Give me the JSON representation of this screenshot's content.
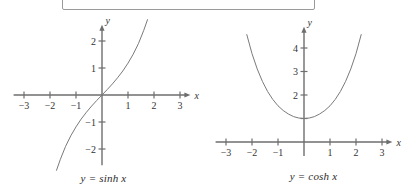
{
  "figure": {
    "background_color": "#ffffff",
    "axis_color": "#6e6e6e",
    "curve_color": "#7a7a7a",
    "text_color": "#333333",
    "box_border_color": "#9a9a9a"
  },
  "top_box": {
    "label": ""
  },
  "panels": [
    {
      "id": "sinh",
      "caption": "y = sinh x",
      "x_axis_name": "x",
      "y_axis_name": "y",
      "x_ticks": [
        "−3",
        "−2",
        "−1",
        "1",
        "2",
        "3"
      ],
      "y_ticks": [
        "2",
        "1",
        "−1",
        "−2"
      ]
    },
    {
      "id": "cosh",
      "caption": "y = cosh x",
      "x_axis_name": "x",
      "y_axis_name": "y",
      "x_ticks": [
        "−3",
        "−2",
        "−1",
        "1",
        "2",
        "3"
      ],
      "y_ticks": [
        "4",
        "3",
        "2"
      ]
    }
  ],
  "chart_data": [
    {
      "type": "line",
      "id": "sinh",
      "title": "y = sinh x",
      "xlabel": "x",
      "ylabel": "y",
      "xlim": [
        -3.4,
        3.4
      ],
      "ylim": [
        -2.6,
        2.6
      ],
      "xticks": [
        -3,
        -2,
        -1,
        1,
        2,
        3
      ],
      "xtick_labels": [
        "−3",
        "−2",
        "−1",
        "1",
        "2",
        "3"
      ],
      "yticks": [
        -2,
        -1,
        1,
        2
      ],
      "ytick_labels": [
        "−2",
        "−1",
        "1",
        "2"
      ],
      "grid": false,
      "legend": "none",
      "series": [
        {
          "name": "sinh x",
          "x": [
            -1.75,
            -1.6,
            -1.4,
            -1.2,
            -1.0,
            -0.8,
            -0.6,
            -0.4,
            -0.2,
            0.0,
            0.2,
            0.4,
            0.6,
            0.8,
            1.0,
            1.2,
            1.4,
            1.6,
            1.75
          ],
          "y": [
            -2.79,
            -2.38,
            -1.9,
            -1.51,
            -1.18,
            -0.89,
            -0.64,
            -0.41,
            -0.2,
            0.0,
            0.2,
            0.41,
            0.64,
            0.89,
            1.18,
            1.51,
            1.9,
            2.38,
            2.79
          ]
        }
      ]
    },
    {
      "type": "line",
      "id": "cosh",
      "title": "y = cosh x",
      "xlabel": "x",
      "ylabel": "y",
      "xlim": [
        -3.4,
        3.4
      ],
      "ylim": [
        -0.6,
        4.9
      ],
      "xticks": [
        -3,
        -2,
        -1,
        1,
        2,
        3
      ],
      "xtick_labels": [
        "−3",
        "−2",
        "−1",
        "1",
        "2",
        "3"
      ],
      "yticks": [
        1,
        2,
        3,
        4
      ],
      "ytick_labels": [
        "",
        "2",
        "3",
        "4"
      ],
      "grid": false,
      "legend": "none",
      "series": [
        {
          "name": "cosh x",
          "x": [
            -2.2,
            -2.0,
            -1.8,
            -1.6,
            -1.4,
            -1.2,
            -1.0,
            -0.8,
            -0.6,
            -0.4,
            -0.2,
            0.0,
            0.2,
            0.4,
            0.6,
            0.8,
            1.0,
            1.2,
            1.4,
            1.6,
            1.8,
            2.0,
            2.2
          ],
          "y": [
            4.57,
            3.76,
            3.11,
            2.58,
            2.15,
            1.81,
            1.54,
            1.34,
            1.19,
            1.08,
            1.02,
            1.0,
            1.02,
            1.08,
            1.19,
            1.34,
            1.54,
            1.81,
            2.15,
            2.58,
            3.11,
            3.76,
            4.57
          ]
        }
      ]
    }
  ]
}
